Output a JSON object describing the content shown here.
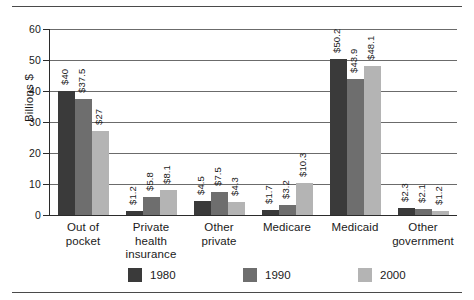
{
  "chart_data": {
    "type": "bar",
    "title": "",
    "xlabel": "",
    "ylabel": "Billions $",
    "ylim": [
      0,
      60
    ],
    "yticks": [
      0,
      10,
      20,
      30,
      40,
      50,
      60
    ],
    "ytick_labels": [
      "0",
      "10",
      "20",
      "30",
      "40",
      "50",
      "60"
    ],
    "grid": true,
    "legend_position": "bottom",
    "categories": [
      "Out of pocket",
      "Private health insurance",
      "Other private",
      "Medicare",
      "Medicaid",
      "Other government"
    ],
    "category_lines": [
      [
        "Out of",
        "pocket"
      ],
      [
        "Private",
        "health",
        "insurance"
      ],
      [
        "Other",
        "private"
      ],
      [
        "Medicare"
      ],
      [
        "Medicaid"
      ],
      [
        "Other",
        "government"
      ]
    ],
    "series": [
      {
        "name": "1980",
        "color": "#3a3a3a",
        "values": [
          40,
          1.2,
          4.5,
          1.7,
          50.2,
          2.3
        ],
        "labels": [
          "$40",
          "$1.2",
          "$4.5",
          "$1.7",
          "$50.2",
          "$2.3"
        ]
      },
      {
        "name": "1990",
        "color": "#6e6e6e",
        "values": [
          37.5,
          5.8,
          7.5,
          3.2,
          43.9,
          2.1
        ],
        "labels": [
          "$37.5",
          "$5.8",
          "$7.5",
          "$3.2",
          "$43.9",
          "$2.1"
        ]
      },
      {
        "name": "2000",
        "color": "#b4b4b4",
        "values": [
          27,
          8.1,
          4.3,
          10.3,
          48.1,
          1.2
        ],
        "labels": [
          "$27",
          "$8.1",
          "$4.3",
          "$10.3",
          "$48.1",
          "$1.2"
        ]
      }
    ]
  },
  "legend": {
    "items": [
      {
        "label": "1980",
        "color": "#3a3a3a"
      },
      {
        "label": "1990",
        "color": "#6e6e6e"
      },
      {
        "label": "2000",
        "color": "#b4b4b4"
      }
    ]
  }
}
